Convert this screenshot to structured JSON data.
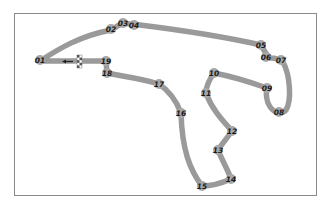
{
  "diagram": {
    "type": "race-circuit-map",
    "colors": {
      "track": "#9a9a9a",
      "turn_marker": "#a8a8a8",
      "label": "#1a1a1a",
      "frame": "#8a8a8a",
      "background": "#ffffff"
    },
    "start_finish": {
      "label": "start-finish-line",
      "direction": "left"
    },
    "turns": [
      {
        "label": "01",
        "x": 40,
        "y": 60
      },
      {
        "label": "02",
        "x": 111,
        "y": 29
      },
      {
        "label": "03",
        "x": 123,
        "y": 23
      },
      {
        "label": "04",
        "x": 134,
        "y": 25
      },
      {
        "label": "05",
        "x": 261,
        "y": 45
      },
      {
        "label": "06",
        "x": 266,
        "y": 57
      },
      {
        "label": "07",
        "x": 281,
        "y": 60
      },
      {
        "label": "08",
        "x": 279,
        "y": 112
      },
      {
        "label": "09",
        "x": 267,
        "y": 88
      },
      {
        "label": "10",
        "x": 214,
        "y": 73
      },
      {
        "label": "11",
        "x": 206,
        "y": 93
      },
      {
        "label": "12",
        "x": 232,
        "y": 131
      },
      {
        "label": "13",
        "x": 218,
        "y": 150
      },
      {
        "label": "14",
        "x": 231,
        "y": 179
      },
      {
        "label": "15",
        "x": 202,
        "y": 186
      },
      {
        "label": "16",
        "x": 181,
        "y": 113
      },
      {
        "label": "17",
        "x": 159,
        "y": 84
      },
      {
        "label": "18",
        "x": 107,
        "y": 73
      },
      {
        "label": "19",
        "x": 106,
        "y": 61
      }
    ]
  }
}
